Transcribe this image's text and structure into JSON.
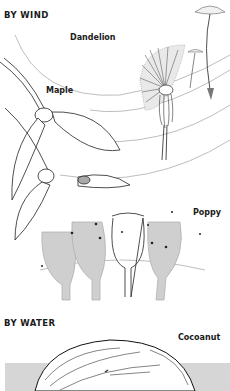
{
  "sections": {
    "wind": {
      "heading": "BY WIND",
      "labels": {
        "dandelion": "Dandelion",
        "maple": "Maple",
        "poppy": "Poppy"
      }
    },
    "water": {
      "heading": "BY WATER",
      "labels": {
        "coconut": "Cocoanut"
      }
    }
  },
  "colors": {
    "ink": "#1a1a1a",
    "wind_lines": "#b5b5b5",
    "gray_fill": "#cfcfcf",
    "water_band": "#d6d6d6"
  }
}
